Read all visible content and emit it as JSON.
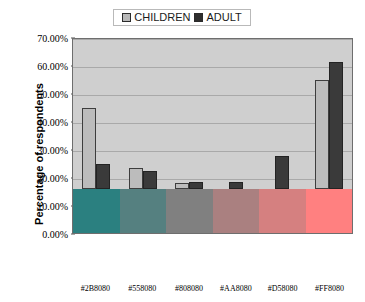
{
  "legend": {
    "entries": [
      {
        "label": "CHILDREN",
        "swatch_color": "#B8B8B8",
        "icon": "legend-swatch-icon"
      },
      {
        "label": "ADULT",
        "swatch_color": "#2E2E2E",
        "icon": "legend-swatch-icon"
      }
    ]
  },
  "axes": {
    "y_title": "Percentage of respondents",
    "y_ticks": [
      "0.00%",
      "10.00%",
      "20.00%",
      "30.00%",
      "40.00%",
      "50.00%",
      "60.00%",
      "70.00%"
    ],
    "x_labels": [
      "#2B8080",
      "#558080",
      "#808080",
      "#AA8080",
      "#D58080",
      "#FF8080"
    ]
  },
  "swatch_band": {
    "colors": [
      "#2B8080",
      "#558080",
      "#808080",
      "#AA8080",
      "#D58080",
      "#FF8080"
    ]
  },
  "chart_data": {
    "type": "bar",
    "title": "",
    "subtitle": "",
    "xlabel": "",
    "ylabel": "Percentage of respondents",
    "categories": [
      "#2B8080",
      "#558080",
      "#808080",
      "#AA8080",
      "#D58080",
      "#FF8080"
    ],
    "series": [
      {
        "name": "CHILDREN",
        "color": "#B8B8B8",
        "values": [
          37.5,
          9.5,
          3.0,
          0.0,
          0.0,
          50.2
        ]
      },
      {
        "name": "ADULT",
        "color": "#2E2E2E",
        "values": [
          11.7,
          8.5,
          3.3,
          3.3,
          15.0,
          58.5
        ]
      }
    ],
    "ylim": [
      0,
      70
    ],
    "ytick_step": 10,
    "ytick_format": "percent",
    "grid": true,
    "legend_position": "top-center",
    "plot_background": "#CFCFCF",
    "annotations": []
  }
}
